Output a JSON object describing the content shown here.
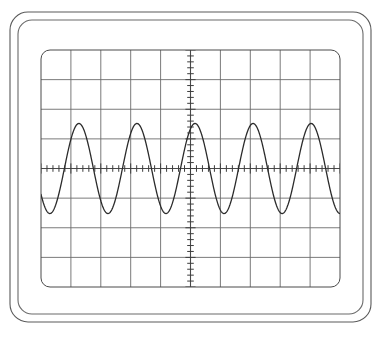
{
  "device": {
    "name": "oscilloscope-display",
    "background_color": "#ffffff",
    "bezel": {
      "outer": {
        "x": 10,
        "y": 12,
        "width": 361,
        "height": 310,
        "radius": 18,
        "stroke_color": "#5a5a5a",
        "stroke_width": 1.1
      },
      "inner": {
        "x": 18,
        "y": 20,
        "width": 345,
        "height": 294,
        "radius": 14,
        "stroke_color": "#6a6a6a",
        "stroke_width": 1.1
      }
    },
    "screen": {
      "x": 41,
      "y": 50,
      "width": 299,
      "height": 237,
      "radius": 9,
      "border_color": "#4a4a4a",
      "border_width": 1.0,
      "fill_color": "#ffffff"
    }
  },
  "graticule": {
    "horizontal_divisions": 10,
    "vertical_divisions": 8,
    "division_width_px": 29.9,
    "division_height_px": 29.625,
    "grid_line_color": "#6b6b6b",
    "grid_line_width": 0.9,
    "axis_line_color": "#4a4a4a",
    "axis_line_width": 1.1,
    "subdivisions_per_division": 5,
    "tick_length_px": 6,
    "tick_color": "#3d3d3d",
    "tick_width": 1.0,
    "center_x_px": 190.5,
    "center_y_px": 168.5
  },
  "chart_data": {
    "type": "line",
    "title": "",
    "xlabel": "",
    "ylabel": "",
    "waveform_shape": "sine",
    "cycles_on_screen": 5.15,
    "amplitude_divisions": 0.8,
    "vertical_offset_divisions": 0.0,
    "phase_degrees": 215,
    "trace_color": "#2b2b2b",
    "trace_width": 1.3,
    "xlim": [
      -5,
      5
    ],
    "ylim": [
      -4,
      4
    ],
    "grid": true,
    "legend": null,
    "x": [
      -5.0,
      -4.9,
      -4.8,
      -4.7,
      -4.6,
      -4.5,
      -4.4,
      -4.3,
      -4.2,
      -4.1,
      -4.0,
      -3.9,
      -3.8,
      -3.7,
      -3.6,
      -3.5,
      -3.4,
      -3.3,
      -3.2,
      -3.1,
      -3.0,
      -2.9,
      -2.8,
      -2.7,
      -2.6,
      -2.5,
      -2.4,
      -2.3,
      -2.2,
      -2.1,
      -2.0,
      -1.9,
      -1.8,
      -1.7,
      -1.6,
      -1.5,
      -1.4,
      -1.3,
      -1.2,
      -1.1,
      -1.0,
      -0.9,
      -0.8,
      -0.7,
      -0.6,
      -0.5,
      -0.4,
      -0.3,
      -0.2,
      -0.1,
      0.0,
      0.1,
      0.2,
      0.3,
      0.4,
      0.5,
      0.6,
      0.7,
      0.8,
      0.9,
      1.0,
      1.1,
      1.2,
      1.3,
      1.4,
      1.5,
      1.6,
      1.7,
      1.8,
      1.9,
      2.0,
      2.1,
      2.2,
      2.3,
      2.4,
      2.5,
      2.6,
      2.7,
      2.8,
      2.9,
      3.0,
      3.1,
      3.2,
      3.3,
      3.4,
      3.5,
      3.6,
      3.7,
      3.8,
      3.9,
      4.0,
      4.1,
      4.2,
      4.3,
      4.4,
      4.5,
      4.6,
      4.7,
      4.8,
      4.9,
      5.0
    ],
    "y_note": "y = 0.8 * sin(2*pi*5.15/10 * (x + 5) + phase), units = divisions"
  },
  "annotations": {
    "grid_corner_style": "rounded",
    "center_axes": "tick-marked crosshair"
  }
}
